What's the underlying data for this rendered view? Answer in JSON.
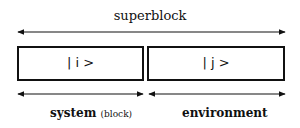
{
  "diagram": {
    "title": "superblock",
    "boxes": [
      {
        "label": "| i >"
      },
      {
        "label": "| j >"
      }
    ],
    "labels": {
      "system": "system",
      "system_note": "(block)",
      "environment": "environment"
    },
    "colors": {
      "stroke": "#111111",
      "background": "#ffffff"
    }
  }
}
